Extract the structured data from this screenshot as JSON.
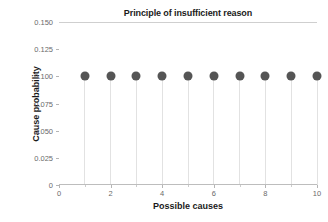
{
  "chart_data": {
    "type": "scatter",
    "title": "Principle of insufficient reason",
    "xlabel": "Possible causes",
    "ylabel": "Cause probability",
    "x": [
      1,
      2,
      3,
      4,
      5,
      6,
      7,
      8,
      9,
      10
    ],
    "values": [
      0.1,
      0.1,
      0.1,
      0.1,
      0.1,
      0.1,
      0.1,
      0.1,
      0.1,
      0.1
    ],
    "xlim": [
      0,
      10
    ],
    "ylim": [
      0,
      0.15
    ],
    "xticks": [
      0,
      2,
      4,
      6,
      8,
      10
    ],
    "xtick_labels": [
      "0",
      "2",
      "4",
      "6",
      "8",
      "10"
    ],
    "xminor_ticks": [
      1,
      3,
      5,
      7,
      9
    ],
    "yticks": [
      0,
      0.025,
      0.05,
      0.075,
      0.1,
      0.125,
      0.15
    ],
    "ytick_labels": [
      "0",
      "0.025",
      "0.050",
      "0.075",
      "0.100",
      "0.125",
      "0.150"
    ],
    "grid": "top-only",
    "legend": "none",
    "marker_style": "filled-circle",
    "stems": true,
    "colors": {
      "marker": "#555555",
      "stem": "#e2e2e2",
      "gridline": "#cfcfcf",
      "axis": "#bdbdbd",
      "tick_label": "#6a6a6a",
      "axis_label": "#1a1a1a",
      "background": "#ffffff"
    }
  }
}
